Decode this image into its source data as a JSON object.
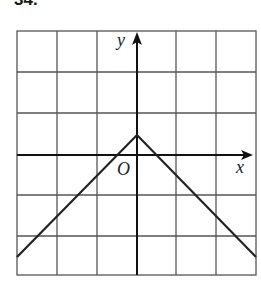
{
  "problem": {
    "number": "34."
  },
  "graph": {
    "x_axis_label": "x",
    "y_axis_label": "y",
    "origin_label": "O",
    "grid": {
      "columns": 6,
      "rows": 6,
      "x_range": [
        -3,
        3
      ],
      "y_range": [
        -3,
        3
      ]
    },
    "function": "y = -|x| + 1/2",
    "vertex": [
      0,
      0.5
    ],
    "line_color": "#222222",
    "grid_color": "#555555"
  }
}
